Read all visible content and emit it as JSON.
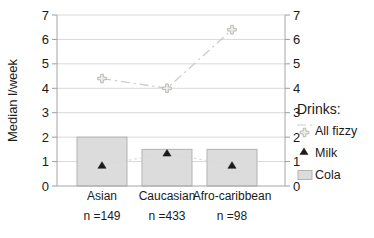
{
  "chart_data": {
    "type": "combo-bar-line",
    "title": "",
    "ylabel": "Median l/week",
    "categories": [
      "Asian",
      "Caucasian",
      "Afro-caribbean"
    ],
    "category_sublabels": [
      "n =149",
      "n =433",
      "n =98"
    ],
    "ylim": [
      0,
      7
    ],
    "yticks": [
      0,
      1,
      2,
      3,
      4,
      5,
      6,
      7
    ],
    "dual_axis": true,
    "grid": "horizontal",
    "legend": {
      "title": "Drinks:",
      "position": "right"
    },
    "series": [
      {
        "name": "All fizzy",
        "type": "line",
        "marker": "fizzy-cross",
        "line_style": "dash-dot",
        "color": "#c9cdc9",
        "marker_fill": "#edefeb",
        "marker_stroke": "#b4b8b2",
        "values": [
          4.4,
          4.0,
          6.4
        ]
      },
      {
        "name": "Milk",
        "type": "line",
        "marker": "triangle",
        "line_style": "dotted",
        "color": "#d8d8d8",
        "marker_fill": "#1a1a1a",
        "marker_stroke": "#1a1a1a",
        "values": [
          0.85,
          1.35,
          0.85
        ]
      },
      {
        "name": "Cola",
        "type": "bar",
        "color": "#dcdcdc",
        "border_color": "#b3b3b3",
        "values": [
          2.0,
          1.5,
          1.5
        ]
      }
    ],
    "colors": {
      "grid": "#d9d9d9",
      "axis": "#a6a6a6",
      "tick": "#9c9c9c",
      "text": "#1a1a1a"
    }
  }
}
